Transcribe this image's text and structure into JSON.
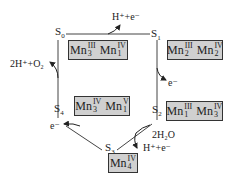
{
  "states": [
    {
      "label": "S",
      "index": "0",
      "mn": [
        {
          "ox": "III",
          "n": "3"
        },
        {
          "ox": "IV",
          "n": "1"
        }
      ]
    },
    {
      "label": "S",
      "index": "1",
      "mn": [
        {
          "ox": "III",
          "n": "2"
        },
        {
          "ox": "IV",
          "n": "2"
        }
      ]
    },
    {
      "label": "S",
      "index": "2",
      "mn": [
        {
          "ox": "III",
          "n": "1"
        },
        {
          "ox": "IV",
          "n": "3"
        }
      ]
    },
    {
      "label": "S",
      "index": "3",
      "mn": [
        {
          "ox": "IV",
          "n": "4"
        }
      ]
    },
    {
      "label": "S",
      "index": "4",
      "mn": [
        {
          "ox": "IV",
          "n": "3"
        },
        {
          "ox": "V",
          "n": "1"
        }
      ]
    }
  ],
  "element": "Mn",
  "transitions": {
    "s0_s1": "H⁺+e⁻",
    "s1_s2": "e⁻",
    "s2_s3_in": "2H₂O",
    "s2_s3_out": "H⁺+e⁻",
    "s3_s4": "e⁻",
    "s4_s0": "2H⁺+O₂"
  }
}
